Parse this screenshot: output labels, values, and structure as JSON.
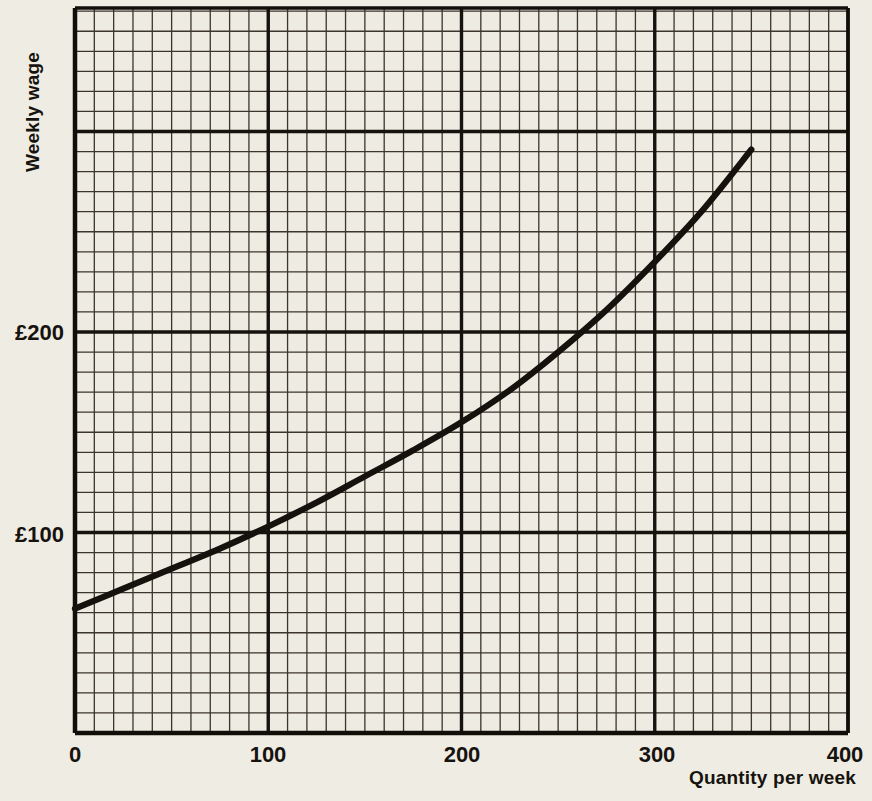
{
  "chart_data": {
    "type": "line",
    "title": "",
    "subtitle": "",
    "xlabel": "Quantity per week",
    "ylabel": "Weekly wage",
    "xlim": [
      0,
      400
    ],
    "ylim": [
      0,
      340
    ],
    "xticks": [
      0,
      100,
      200,
      300,
      400
    ],
    "xticklabels": [
      "0",
      "100",
      "200",
      "300",
      "400"
    ],
    "yticks": [
      100,
      200
    ],
    "yticklabels": [
      "£100",
      "£200"
    ],
    "grid": "true",
    "grid_minor_spacing_x": 10,
    "grid_minor_spacing_y": 10,
    "grid_major_spacing_x": 100,
    "grid_major_spacing_y": 100,
    "legend": "none",
    "series": [
      {
        "name": "Labour supply curve",
        "x": [
          0,
          25,
          50,
          75,
          100,
          125,
          150,
          175,
          200,
          225,
          250,
          275,
          300,
          325,
          350
        ],
        "y": [
          62,
          72,
          82,
          92,
          103,
          115,
          128,
          141,
          155,
          171,
          190,
          211,
          235,
          261,
          291
        ]
      }
    ],
    "annotations": [],
    "colors": {
      "background": "#efece3",
      "plot_background": "#eeebe2",
      "grid_minor": "#3b352c",
      "grid_major": "#16130f",
      "axis": "#110e0a",
      "curve": "#15120d",
      "text": "#16130f"
    }
  },
  "axis_titles": {
    "y": "Weekly wage",
    "x": "Quantity per week"
  },
  "tick_labels": {
    "y": [
      "£200",
      "£100"
    ],
    "x": [
      "0",
      "100",
      "200",
      "300",
      "400"
    ]
  }
}
